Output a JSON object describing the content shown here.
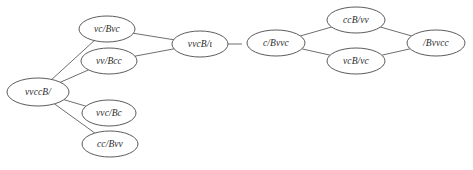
{
  "figure": {
    "background_color": "#ffffff",
    "node_stroke_color": "#4a4a4a",
    "edge_stroke_color": "#5d5d5d",
    "label_color": "#2b2b2b"
  },
  "graphs": [
    {
      "id": "left-graph",
      "type": "tree",
      "nodes": [
        {
          "id": "n0",
          "label": "vvccB/",
          "cx": 38,
          "cy": 92,
          "rx": 31,
          "ry": 14
        },
        {
          "id": "n1",
          "label": "vc/Bvc",
          "cx": 107,
          "cy": 29,
          "rx": 28,
          "ry": 13
        },
        {
          "id": "n2",
          "label": "vv/Bcc",
          "cx": 109,
          "cy": 61,
          "rx": 28,
          "ry": 13
        },
        {
          "id": "n3",
          "label": "vvc/Bc",
          "cx": 109,
          "cy": 113,
          "rx": 27,
          "ry": 13
        },
        {
          "id": "n4",
          "label": "cc/Bvv",
          "cx": 110,
          "cy": 144,
          "rx": 28,
          "ry": 13
        },
        {
          "id": "n5",
          "label": "vvcB/ι",
          "cx": 200,
          "cy": 44,
          "rx": 28,
          "ry": 13
        }
      ],
      "edges": [
        {
          "from": "n0",
          "to": "n1"
        },
        {
          "from": "n0",
          "to": "n2"
        },
        {
          "from": "n0",
          "to": "n3"
        },
        {
          "from": "n0",
          "to": "n4"
        },
        {
          "from": "n1",
          "to": "n5"
        },
        {
          "from": "n2",
          "to": "n5"
        }
      ],
      "dangling_edges": [
        {
          "from": "n5",
          "direction": "right",
          "length": 14
        }
      ]
    },
    {
      "id": "right-graph",
      "type": "diamond",
      "nodes": [
        {
          "id": "m0",
          "label": "c/Bvvc",
          "cx": 276,
          "cy": 43,
          "rx": 29,
          "ry": 13
        },
        {
          "id": "m1",
          "label": "ccB/vv",
          "cx": 356,
          "cy": 20,
          "rx": 29,
          "ry": 13
        },
        {
          "id": "m2",
          "label": "vcB/vc",
          "cx": 356,
          "cy": 61,
          "rx": 29,
          "ry": 13
        },
        {
          "id": "m3",
          "label": "/Bvvcc",
          "cx": 436,
          "cy": 43,
          "rx": 29,
          "ry": 13
        }
      ],
      "edges": [
        {
          "from": "m0",
          "to": "m1"
        },
        {
          "from": "m0",
          "to": "m2"
        },
        {
          "from": "m1",
          "to": "m3"
        },
        {
          "from": "m2",
          "to": "m3"
        }
      ],
      "dangling_edges": []
    }
  ]
}
